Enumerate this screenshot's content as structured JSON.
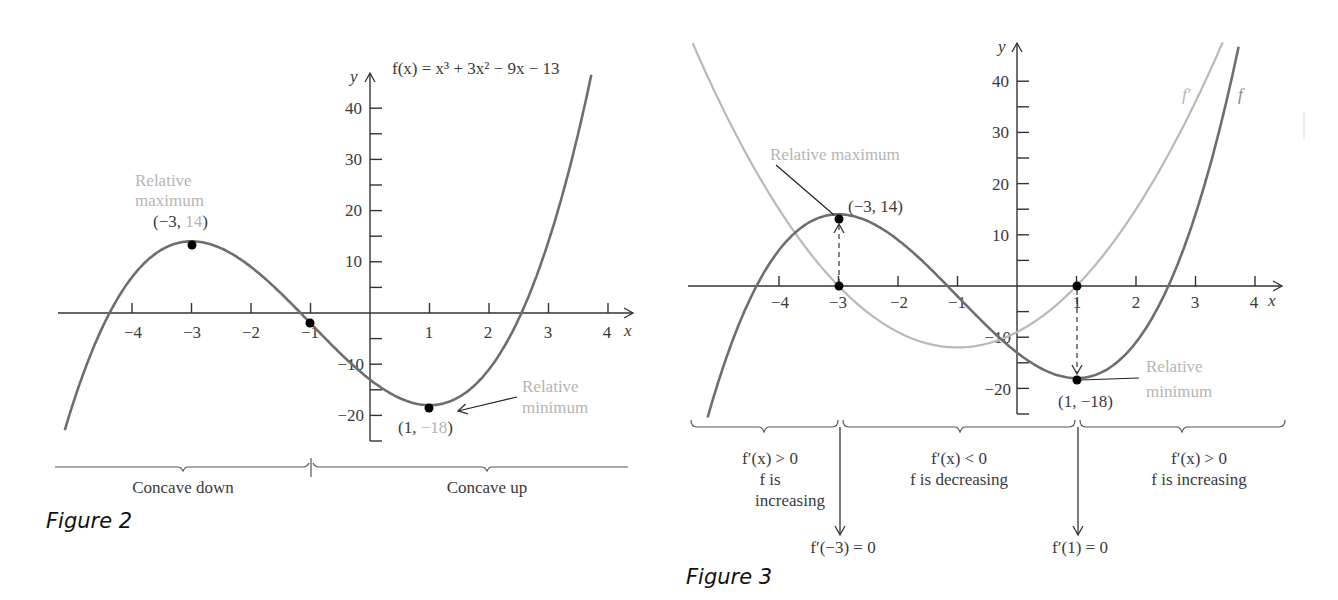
{
  "colors": {
    "curve_f": "#6e6e6e",
    "curve_fprime": "#b9b9b9",
    "annotation_light": "#b5b5b5",
    "text_dark": "#3a3a3a",
    "points": "#000000"
  },
  "figure2": {
    "caption": "Figure 2",
    "equation": "f(x) = x³ + 3x² − 9x − 13",
    "axis_x_label": "x",
    "axis_y_label": "y",
    "x_tick_labels": [
      "−4",
      "−3",
      "−2",
      "−1",
      "1",
      "2",
      "3",
      "4"
    ],
    "y_tick_labels": [
      "40",
      "30",
      "20",
      "10",
      "−10",
      "−20"
    ],
    "max_label_line1": "Relative",
    "max_label_line2": "maximum",
    "max_coord_open": "(−3, ",
    "max_coord_value": "14",
    "max_coord_close": ")",
    "min_label_line1": "Relative",
    "min_label_line2": "minimum",
    "min_coord_open": "(1, ",
    "min_coord_value": "−18",
    "min_coord_close": ")",
    "concave_down": "Concave down",
    "concave_up": "Concave up"
  },
  "figure3": {
    "caption": "Figure 3",
    "axis_x_label": "x",
    "axis_y_label": "y",
    "x_tick_labels": [
      "−4",
      "−3",
      "−2",
      "−1",
      "1",
      "2",
      "3",
      "4"
    ],
    "y_tick_labels": [
      "40",
      "30",
      "20",
      "10",
      "−10",
      "−20"
    ],
    "curve_label_fprime": "f′",
    "curve_label_f": "f",
    "max_label": "Relative maximum",
    "max_coord": "(−3, 14)",
    "min_label_line1": "Relative",
    "min_label_line2": "minimum",
    "min_coord": "(1, −18)",
    "interval1_line1": "f′(x) > 0",
    "interval1_line2": "f is",
    "interval1_line3": "increasing",
    "interval2_line1": "f′(x) < 0",
    "interval2_line2": "f is decreasing",
    "interval3_line1": "f′(x) > 0",
    "interval3_line2": "f is increasing",
    "critical1": "f′(−3) = 0",
    "critical2": "f′(1) = 0"
  },
  "chart_data": [
    {
      "type": "line",
      "title": "Figure 2",
      "function": "f(x) = x^3 + 3x^2 - 9x - 13",
      "coefficients": [
        1,
        3,
        -9,
        -13
      ],
      "xlabel": "x",
      "ylabel": "y",
      "xlim": [
        -5.2,
        4.3
      ],
      "ylim": [
        -25,
        45
      ],
      "x_ticks": [
        -4,
        -3,
        -2,
        -1,
        1,
        2,
        3,
        4
      ],
      "y_ticks": [
        40,
        30,
        20,
        10,
        -10,
        -20
      ],
      "y_minor_ticks": [
        35,
        25,
        15,
        5,
        -5,
        -15,
        -25
      ],
      "series": [
        {
          "name": "f",
          "x": [
            -5,
            -4,
            -3,
            -2,
            -1,
            0,
            1,
            2,
            3,
            3.5
          ],
          "values": [
            -18,
            7,
            14,
            9,
            -2,
            -13,
            -18,
            -11,
            14,
            40.4
          ]
        }
      ],
      "points": [
        {
          "label": "Relative maximum",
          "x": -3,
          "y": 14
        },
        {
          "label": "Inflection point",
          "x": -1,
          "y": -2
        },
        {
          "label": "Relative minimum",
          "x": 1,
          "y": -18
        }
      ],
      "annotations": [
        {
          "text": "Concave down",
          "interval": [
            null,
            -1
          ]
        },
        {
          "text": "Concave up",
          "interval": [
            -1,
            null
          ]
        }
      ],
      "grid": false,
      "legend": null
    },
    {
      "type": "line",
      "title": "Figure 3",
      "xlabel": "x",
      "ylabel": "y",
      "xlim": [
        -5.5,
        4.3
      ],
      "ylim": [
        -25,
        47
      ],
      "x_ticks": [
        -4,
        -3,
        -2,
        -1,
        1,
        2,
        3,
        4
      ],
      "y_ticks": [
        40,
        30,
        20,
        10,
        -10,
        -20
      ],
      "y_minor_ticks": [
        35,
        25,
        15,
        5,
        -5,
        -15,
        -25
      ],
      "series": [
        {
          "name": "f",
          "function": "x^3 + 3x^2 - 9x - 13",
          "coefficients": [
            1,
            3,
            -9,
            -13
          ],
          "x": [
            -5,
            -4,
            -3,
            -2,
            -1,
            0,
            1,
            2,
            3
          ],
          "values": [
            -18,
            7,
            14,
            9,
            -2,
            -13,
            -18,
            -11,
            14
          ]
        },
        {
          "name": "f′",
          "function": "3x^2 + 6x - 9",
          "coefficients": [
            0,
            3,
            6,
            -9
          ],
          "x": [
            -5,
            -4,
            -3,
            -2,
            -1,
            0,
            1,
            2,
            3
          ],
          "values": [
            36,
            15,
            0,
            -9,
            -12,
            -9,
            0,
            15,
            36
          ]
        }
      ],
      "points": [
        {
          "label": "Relative maximum",
          "x": -3,
          "y": 14
        },
        {
          "label": "f′(−3) = 0",
          "x": -3,
          "y": 0
        },
        {
          "label": "f′(1) = 0",
          "x": 1,
          "y": 0
        },
        {
          "label": "Relative minimum",
          "x": 1,
          "y": -18
        }
      ],
      "annotations": [
        {
          "text": "f′(x) > 0, f is increasing",
          "interval": [
            null,
            -3
          ]
        },
        {
          "text": "f′(x) < 0, f is decreasing",
          "interval": [
            -3,
            1
          ]
        },
        {
          "text": "f′(x) > 0, f is increasing",
          "interval": [
            1,
            null
          ]
        }
      ],
      "grid": false,
      "legend": null
    }
  ],
  "layout": {
    "fig2": {
      "ox": 370,
      "oy": 313,
      "sx": 59.5,
      "sy": 5.12,
      "xmin": -5.13,
      "xmax": 3.72,
      "ytop": 73,
      "ybottom": 441,
      "xleft": 58,
      "xright": 635
    },
    "fig3": {
      "ox": 1017,
      "oy": 286,
      "sx": 59.5,
      "sy": 5.12,
      "f_xmin": -5.2,
      "f_xmax": 4.27,
      "fp_xmin": -5.45,
      "fp_xmax": 3.85,
      "ytop": 43,
      "ybottom": 414,
      "xleft": 688,
      "xright": 1283
    }
  }
}
